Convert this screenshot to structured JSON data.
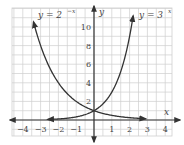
{
  "chart_data": {
    "type": "line",
    "title": "",
    "xlabel": "x",
    "ylabel": "y",
    "xlim": [
      -4.5,
      4.3
    ],
    "ylim": [
      -1.7,
      12
    ],
    "grid": true,
    "x_ticks": [
      -4,
      -3,
      -2,
      -1,
      1,
      2,
      3,
      4
    ],
    "y_ticks": [
      2,
      4,
      6,
      8,
      10
    ],
    "series": [
      {
        "name": "y = 2^-x",
        "label_base": "y = 2",
        "label_exp": "−x",
        "function": "2^(-x)",
        "x_range": [
          -3.4,
          2.9
        ],
        "color": "#333333"
      },
      {
        "name": "y = 3^x",
        "label_base": "y = 3",
        "label_exp": "x",
        "function": "3^x",
        "x_range": [
          -2.6,
          2.2
        ],
        "color": "#333333"
      }
    ],
    "colors": {
      "grid": "#cfcfcf",
      "axis": "#333333",
      "curve": "#333333",
      "text": "#444444"
    }
  }
}
